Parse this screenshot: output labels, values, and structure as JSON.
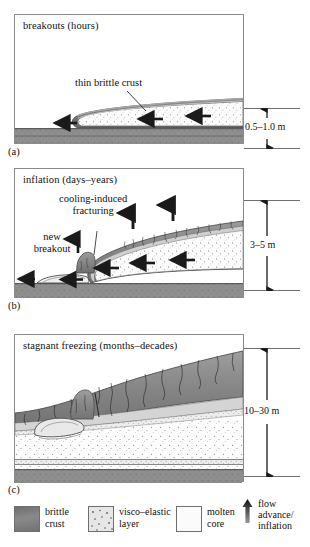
{
  "figure": {
    "kind": "lava-flow-inflation-cross-sections",
    "panels": [
      {
        "letter": "(a)",
        "title": "breakouts (hours)",
        "annotations": [
          {
            "name": "thin-brittle-crust",
            "text": "thin brittle crust"
          }
        ],
        "dimension": {
          "label": "0.5–1.0 m"
        }
      },
      {
        "letter": "(b)",
        "title": "inflation (days–years)",
        "annotations": [
          {
            "name": "cooling-induced-fracturing",
            "line1": "cooling-induced",
            "line2": "fracturing"
          },
          {
            "name": "new-breakout",
            "line1": "new",
            "line2": "breakout"
          }
        ],
        "dimension": {
          "label": "3–5 m"
        }
      },
      {
        "letter": "(c)",
        "title": "stagnant freezing (months–decades)",
        "annotations": [],
        "dimension": {
          "label": "10–30 m"
        }
      }
    ]
  },
  "legend": {
    "items": [
      {
        "name": "brittle-crust",
        "line1": "brittle",
        "line2": "crust",
        "swatch": "dark-gray-gradient",
        "color": "#7b7b7b"
      },
      {
        "name": "visco-elastic-layer",
        "line1": "visco–elastic",
        "line2": "layer",
        "swatch": "stippled-light-gray",
        "color": "#dcdcdc"
      },
      {
        "name": "molten-core",
        "line1": "molten",
        "line2": "core",
        "swatch": "white",
        "color": "#fbfbfb"
      },
      {
        "name": "flow-advance",
        "line1": "flow",
        "line2": "advance/",
        "line3": "inflation",
        "swatch": "up-arrow",
        "color": "#1a1a1a"
      }
    ]
  },
  "colors": {
    "crust_dark": "#6e6e6e",
    "crust_mid": "#8a8a8a",
    "visco": "#d9d9d9",
    "molten": "#fcfcfc",
    "substrate": "#8b8b8b",
    "outline": "#5a5a5a",
    "arrow": "#1a1a1a",
    "frame": "#8b8b8b"
  }
}
